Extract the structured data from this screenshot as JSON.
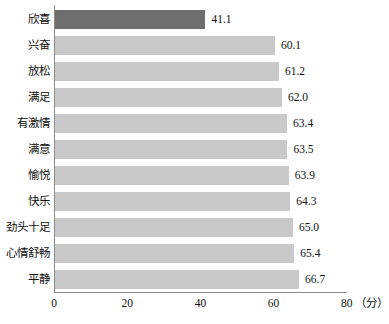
{
  "chart_data": {
    "type": "bar",
    "orientation": "horizontal",
    "title": "",
    "xlabel": "（分）",
    "ylabel": "",
    "xlim": [
      0,
      80
    ],
    "xticks": [
      0,
      20,
      40,
      60,
      80
    ],
    "xtick_labels": [
      "0",
      "20",
      "40",
      "60",
      "80"
    ],
    "grid": false,
    "legend": false,
    "categories": [
      "欣喜",
      "兴奋",
      "放松",
      "满足",
      "有激情",
      "满意",
      "愉悦",
      "快乐",
      "劲头十足",
      "心情舒畅",
      "平静"
    ],
    "values": [
      41.1,
      60.1,
      61.2,
      62.0,
      63.4,
      63.5,
      63.9,
      64.3,
      65.0,
      65.4,
      66.7
    ],
    "value_labels": [
      "41.1",
      "60.1",
      "61.2",
      "62.0",
      "63.4",
      "63.5",
      "63.9",
      "64.3",
      "65.0",
      "65.4",
      "66.7"
    ],
    "bar_colors": [
      "#6e6e6e",
      "#c9c9c9",
      "#c9c9c9",
      "#c9c9c9",
      "#c9c9c9",
      "#c9c9c9",
      "#c9c9c9",
      "#c9c9c9",
      "#c9c9c9",
      "#c9c9c9",
      "#c9c9c9"
    ],
    "highlight_index": 0,
    "colors": {
      "highlight_bar": "#6e6e6e",
      "default_bar": "#c9c9c9",
      "axis": "#8a8a8a",
      "text": "#111111",
      "background": "#ffffff"
    }
  },
  "axis": {
    "unit_label": "（分）"
  }
}
